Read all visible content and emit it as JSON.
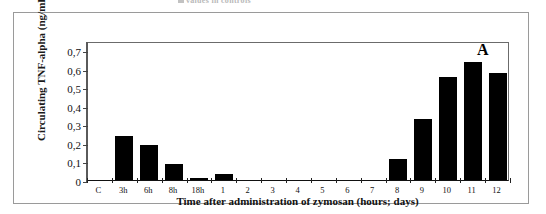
{
  "figure": {
    "panel_label": "A",
    "top_caption_fragment": "values in controls"
  },
  "chart_data": {
    "type": "bar",
    "title": "",
    "xlabel": "Time after administration of zymosan (hours; days)",
    "ylabel": "Circulating TNF-alpha (ng/mL)",
    "categories": [
      "C",
      "3h",
      "6h",
      "8h",
      "18h",
      "1",
      "2",
      "3",
      "4",
      "5",
      "6",
      "7",
      "8",
      "9",
      "10",
      "11",
      "12"
    ],
    "values": [
      0,
      0.24,
      0.19,
      0.085,
      0.01,
      0.035,
      0,
      0,
      0,
      0,
      0,
      0,
      0.115,
      0.33,
      0.555,
      0.635,
      0.575
    ],
    "ylim": [
      0,
      0.75
    ],
    "yticks": [
      0,
      0.1,
      0.2,
      0.3,
      0.4,
      0.5,
      0.6,
      0.7
    ],
    "ytick_labels": [
      "0",
      "0,1",
      "0,2",
      "0,3",
      "0,4",
      "0,5",
      "0,6",
      "0,7"
    ],
    "grid": false,
    "legend": false,
    "bar_color": "#000000",
    "axis_color": "#222222",
    "decimal_separator": ","
  }
}
